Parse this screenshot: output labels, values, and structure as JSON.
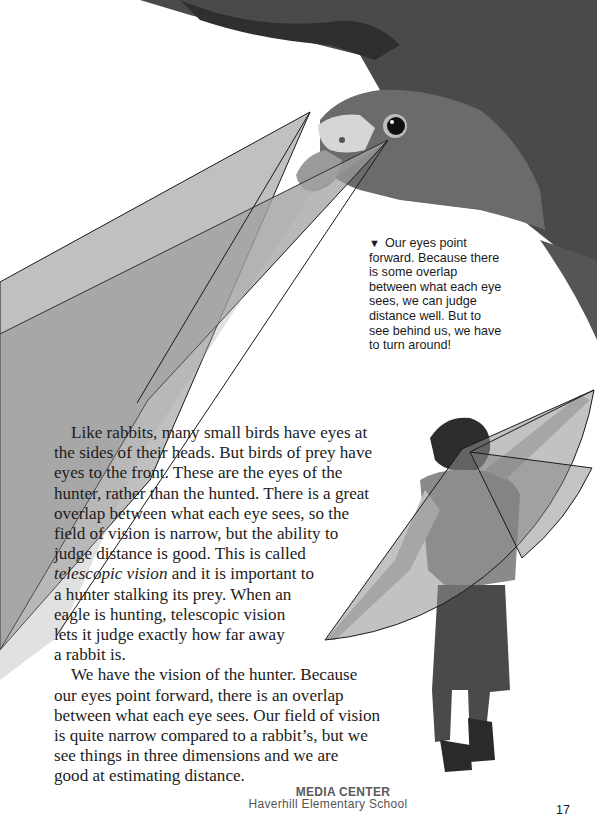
{
  "caption": {
    "marker": "▼",
    "lines": [
      "Our eyes point",
      "forward. Because there",
      "is some overlap",
      "between what each eye",
      "sees, we can judge",
      "distance well. But to",
      "see behind us, we have",
      "to turn around!"
    ]
  },
  "body": {
    "paragraph1": {
      "lines": [
        "Like rabbits, many small birds have eyes at",
        "the sides of their heads. But birds of prey have",
        "eyes to the front. These are the eyes of the",
        "hunter, rather than the hunted. There is a great",
        "overlap between what each eye sees, so the",
        "field of vision is narrow, but the ability to",
        "judge distance is good. This is called"
      ],
      "italic_term": "telescopic vision",
      "line8_rest": " and it is important to",
      "lines_after": [
        "a hunter stalking its prey. When an",
        "eagle is hunting, telescopic vision",
        "lets it judge exactly how far away",
        "a rabbit is."
      ]
    },
    "paragraph2": {
      "lines": [
        "We have the vision of the hunter. Because",
        "our eyes point forward, there is an overlap",
        "between what each eye sees. Our field of vision",
        "is quite narrow compared to a rabbit’s, but we",
        "see things in three dimensions and we are",
        "good at estimating distance."
      ]
    }
  },
  "stamp": {
    "line1": "MEDIA CENTER",
    "line2": "Haverhill Elementary School"
  },
  "page_number": "17",
  "colors": {
    "field_light": "#b3b3b3",
    "field_dark": "#8a8a8a",
    "outline": "#1a1a1a"
  }
}
